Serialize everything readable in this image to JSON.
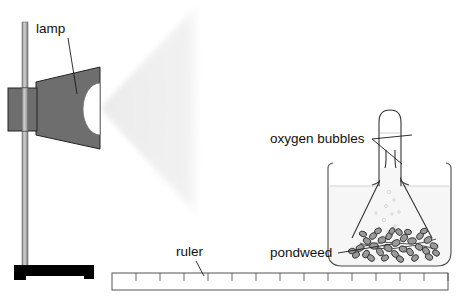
{
  "diagram": {
    "background_color": "#ffffff",
    "width": 462,
    "height": 299,
    "labels": [
      {
        "id": "lamp",
        "text": "lamp",
        "x": 36,
        "y": 33,
        "anchor": "start"
      },
      {
        "id": "oxygen-bubbles",
        "text": "oxygen bubbles",
        "x": 270,
        "y": 143,
        "anchor": "start"
      },
      {
        "id": "pondweed",
        "text": "pondweed",
        "x": 270,
        "y": 257,
        "anchor": "start"
      },
      {
        "id": "ruler",
        "text": "ruler",
        "x": 176,
        "y": 256,
        "anchor": "start"
      }
    ],
    "leader_lines": [
      {
        "id": "lamp-leader",
        "from_x": 68,
        "from_y": 38,
        "to_x": 76,
        "to_y": 93
      },
      {
        "id": "oxygen-leader-tube",
        "from_x": 372,
        "from_y": 139,
        "to_x": 410,
        "to_y": 136
      },
      {
        "id": "oxygen-leader-stem",
        "from_x": 372,
        "from_y": 139,
        "to_x": 401,
        "to_y": 163
      },
      {
        "id": "pondweed-leader",
        "from_x": 338,
        "from_y": 253,
        "to_x": 388,
        "to_y": 245
      },
      {
        "id": "ruler-leader",
        "from_x": 196,
        "from_y": 262,
        "to_x": 203,
        "to_y": 277
      }
    ],
    "components": {
      "stand": {
        "name": "retort-stand",
        "rod_color": "#b5b5b5",
        "rod_edge_color": "#6f6f6f",
        "base_color": "#000000",
        "rod_x": 22,
        "rod_top": 22,
        "rod_bottom": 265,
        "rod_width": 6,
        "base_x": 14,
        "base_y": 265,
        "base_width": 80,
        "base_height": 11
      },
      "lamp": {
        "name": "lamp",
        "body_color": "#6e6e6e",
        "edge_color": "#1f1f1f",
        "box_x": 8,
        "box_y": 88,
        "box_width": 28,
        "box_height": 42,
        "cone_left_top": 82,
        "cone_left_bottom": 135,
        "cone_right_top": 67,
        "cone_right_bottom": 148,
        "bulb_color": "#ffffff"
      },
      "light_beam": {
        "name": "light-beam",
        "color": "#ededed",
        "apex_x": 102,
        "apex_y": 108,
        "far_x": 196,
        "far_top": 4,
        "far_bottom": 215
      },
      "beaker": {
        "name": "beaker",
        "x": 327,
        "y": 167,
        "width": 125,
        "height": 100,
        "water_line_y": 186,
        "water_color": "#f5f5f5"
      },
      "funnel": {
        "name": "inverted-funnel",
        "mouth_left_x": 352,
        "mouth_right_x": 432,
        "mouth_y": 237,
        "stem_left_x": 385,
        "stem_right_x": 396,
        "stem_top_y": 150
      },
      "test_tube": {
        "name": "inverted-test-tube",
        "x": 379,
        "y": 110,
        "width": 22,
        "height": 75,
        "gas_level_y": 133
      },
      "pondweed": {
        "name": "pondweed",
        "leaf_count": 34,
        "cluster_x": 358,
        "cluster_y": 233,
        "cluster_width": 76,
        "cluster_height": 26
      },
      "ruler": {
        "name": "ruler",
        "x": 112,
        "y": 273,
        "width": 336,
        "height": 17,
        "tick_count": 14,
        "tick_height": 8
      }
    }
  }
}
